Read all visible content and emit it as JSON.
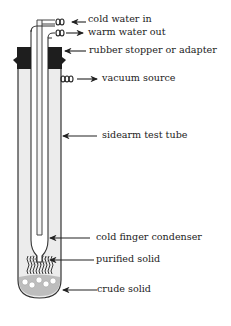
{
  "diagram": {
    "labels": {
      "cold_water_in": "cold water in",
      "warm_water_out": "warm water out",
      "stopper": "rubber stopper or adapter",
      "vacuum": "vacuum source",
      "test_tube": "sidearm test tube",
      "condenser": "cold finger condenser",
      "purified": "purified solid",
      "crude": "crude solid"
    },
    "colors": {
      "line": "#333333",
      "glass": "#ececec",
      "stopper": "#1e1e1e",
      "background": "#ffffff"
    }
  }
}
